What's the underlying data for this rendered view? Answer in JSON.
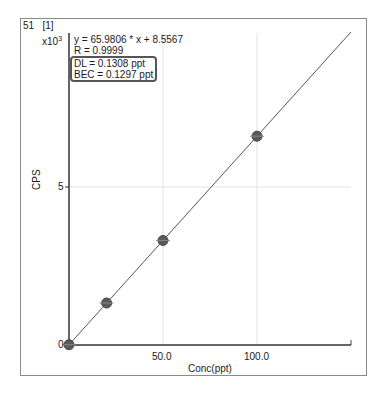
{
  "header": {
    "element_mass": "51",
    "index": "[1]",
    "y_scale": "x10",
    "y_scale_exp": "3"
  },
  "annotations": {
    "equation": "y = 65.9806 * x  + 8.5567",
    "r_value": "R =  0.9999",
    "dl": "DL = 0.1308 ppt",
    "bec": "BEC = 0.1297 ppt"
  },
  "chart_data": {
    "type": "scatter",
    "title": "51  [1]",
    "xlabel": "Conc(ppt)",
    "ylabel": "CPS",
    "y_multiplier": "x10^3",
    "x_ticks": [
      "50.0",
      "100.0"
    ],
    "y_ticks": [
      "0",
      "5"
    ],
    "xlim": [
      0,
      150
    ],
    "ylim": [
      0,
      10000
    ],
    "grid": true,
    "series": [
      {
        "name": "Calibration standards",
        "x": [
          0,
          20,
          50,
          100
        ],
        "y": [
          9,
          1328,
          3308,
          6607
        ]
      },
      {
        "name": "Fit line",
        "type": "line",
        "slope": 65.9806,
        "intercept": 8.5567,
        "r": 0.9999
      }
    ],
    "colors": {
      "axis": "#333333",
      "grid": "#dddddd",
      "line": "#555555",
      "marker": "#555555"
    }
  }
}
